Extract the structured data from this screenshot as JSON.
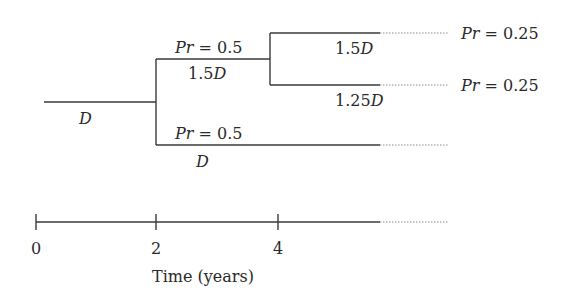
{
  "diagram": {
    "type": "binomial-tree",
    "nodes": {
      "root": {
        "value_var": "D",
        "value_coef": ""
      },
      "up": {
        "prob_var": "Pr",
        "prob_eq": " = 0.5",
        "value_coef": "1.5",
        "value_var": "D"
      },
      "down": {
        "prob_var": "Pr",
        "prob_eq": " = 0.5",
        "value_coef": "",
        "value_var": "D"
      },
      "up_up": {
        "value_coef": "1.5",
        "value_var": "D",
        "prob_var": "Pr",
        "prob_eq": " = 0.25"
      },
      "up_down": {
        "value_coef": "1.25",
        "value_var": "D",
        "prob_var": "Pr",
        "prob_eq": " = 0.25"
      }
    },
    "timeline": {
      "ticks": [
        "0",
        "2",
        "4"
      ],
      "axis_label": "Time (years)"
    },
    "colors": {
      "line": "#3a3a3a",
      "dotted": "#8a8a8a",
      "text": "#2a2a2a"
    }
  }
}
